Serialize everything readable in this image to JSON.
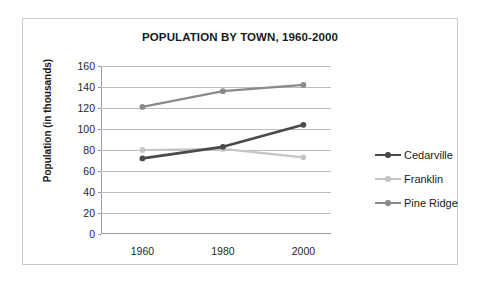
{
  "chart_data": {
    "type": "line",
    "title": "POPULATION BY TOWN, 1960-2000",
    "xlabel": "",
    "ylabel": "Population (in thousands)",
    "categories": [
      "1960",
      "1980",
      "2000"
    ],
    "x": [
      1960,
      1980,
      2000
    ],
    "ylim": [
      0,
      160
    ],
    "ytick_step": 20,
    "yticks": [
      "0",
      "20",
      "40",
      "60",
      "80",
      "100",
      "120",
      "140",
      "160"
    ],
    "grid": true,
    "legend_position": "right",
    "series": [
      {
        "name": "Cedarville",
        "values": [
          72,
          83,
          104
        ],
        "color": "#4a4a4a"
      },
      {
        "name": "Franklin",
        "values": [
          80,
          81,
          73
        ],
        "color": "#c6c6c6"
      },
      {
        "name": "Pine Ridge",
        "values": [
          121,
          136,
          142
        ],
        "color": "#8a8a8a"
      }
    ]
  },
  "legend": {
    "items": [
      {
        "label": "Cedarville",
        "color": "#4a4a4a"
      },
      {
        "label": "Franklin",
        "color": "#c6c6c6"
      },
      {
        "label": "Pine Ridge",
        "color": "#8a8a8a"
      }
    ]
  },
  "colors": {
    "frame_border": "#c9c9c9",
    "gridline": "#bcbcbc",
    "axis": "#9a9a9a",
    "text": "#1a1a1a",
    "background": "#ffffff"
  }
}
